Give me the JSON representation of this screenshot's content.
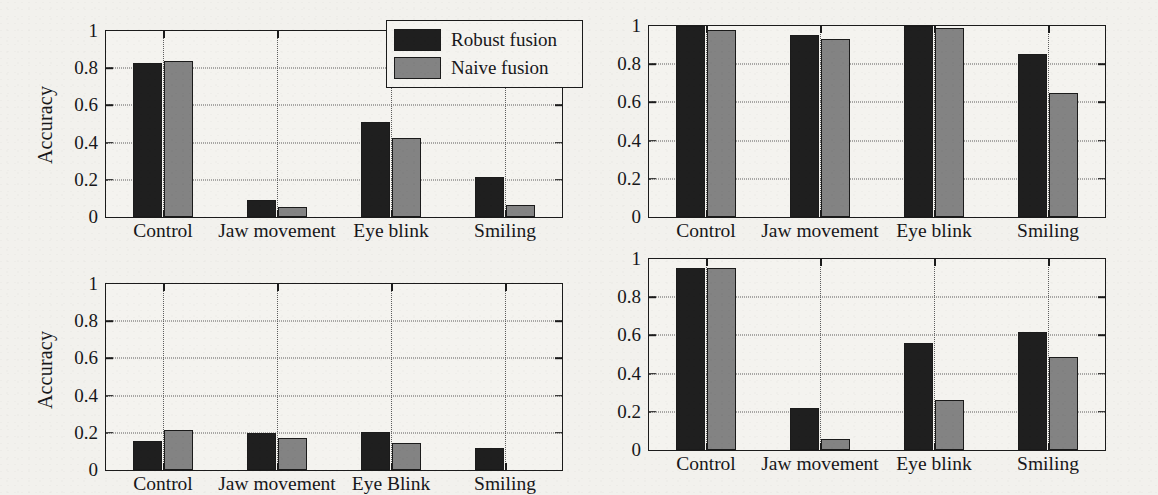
{
  "figure": {
    "background_color": "#f2f1ed",
    "series_colors": {
      "robust": "#1f1f1f",
      "naive": "#838383"
    },
    "axis_color": "#1b1b1b",
    "grid_color": "#5d5d5d"
  },
  "legend": {
    "position": "top-right-of-panel-1",
    "entries": [
      {
        "label": "Robust fusion",
        "color": "#1f1f1f"
      },
      {
        "label": "Naive fusion",
        "color": "#838383"
      }
    ]
  },
  "chart_data": [
    {
      "id": "panel-top-left",
      "type": "bar",
      "title": "",
      "xlabel": "",
      "ylabel": "Accuracy",
      "ylim": [
        0,
        1
      ],
      "yticks": [
        "0",
        "0.2",
        "0.4",
        "0.6",
        "0.8",
        "1"
      ],
      "grid": true,
      "categories": [
        "Control",
        "Jaw movement",
        "Eye blink",
        "Smiling"
      ],
      "series": [
        {
          "name": "Robust fusion",
          "values": [
            0.83,
            0.09,
            0.51,
            0.215
          ]
        },
        {
          "name": "Naive fusion",
          "values": [
            0.84,
            0.055,
            0.425,
            0.065
          ]
        }
      ]
    },
    {
      "id": "panel-top-right",
      "type": "bar",
      "title": "",
      "xlabel": "",
      "ylabel": "Accuracy",
      "ylim": [
        0,
        1
      ],
      "yticks": [
        "0",
        "0.2",
        "0.4",
        "0.6",
        "0.8",
        "1"
      ],
      "grid": true,
      "categories": [
        "Control",
        "Jaw movement",
        "Eye blink",
        "Smiling"
      ],
      "series": [
        {
          "name": "Robust fusion",
          "values": [
            1.0,
            0.955,
            1.0,
            0.855
          ]
        },
        {
          "name": "Naive fusion",
          "values": [
            0.98,
            0.93,
            0.99,
            0.65
          ]
        }
      ]
    },
    {
      "id": "panel-bottom-left",
      "type": "bar",
      "title": "",
      "xlabel": "",
      "ylabel": "Accuracy",
      "ylim": [
        0,
        1
      ],
      "yticks": [
        "0",
        "0.2",
        "0.4",
        "0.6",
        "0.8",
        "1"
      ],
      "grid": true,
      "categories": [
        "Control",
        "Jaw movement",
        "Eye Blink",
        "Smiling"
      ],
      "series": [
        {
          "name": "Robust fusion",
          "values": [
            0.155,
            0.2,
            0.205,
            0.12
          ]
        },
        {
          "name": "Naive fusion",
          "values": [
            0.215,
            0.17,
            0.145,
            0.0
          ]
        }
      ]
    },
    {
      "id": "panel-bottom-right",
      "type": "bar",
      "title": "",
      "xlabel": "",
      "ylabel": "Accuracy",
      "ylim": [
        0,
        1
      ],
      "yticks": [
        "0",
        "0.2",
        "0.4",
        "0.6",
        "0.8",
        "1"
      ],
      "grid": true,
      "categories": [
        "Control",
        "Jaw movement",
        "Eye blink",
        "Smiling"
      ],
      "series": [
        {
          "name": "Robust fusion",
          "values": [
            0.955,
            0.22,
            0.56,
            0.62
          ]
        },
        {
          "name": "Naive fusion",
          "values": [
            0.955,
            0.06,
            0.26,
            0.485
          ]
        }
      ]
    }
  ]
}
